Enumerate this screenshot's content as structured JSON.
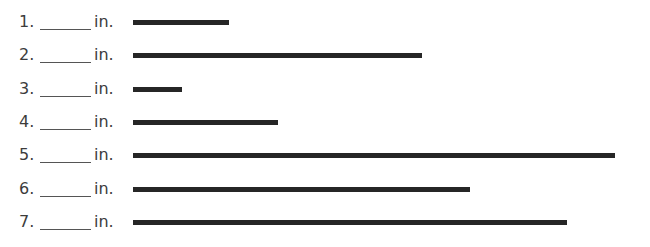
{
  "worksheet": {
    "unit_label": "in.",
    "bar_color": "#262626",
    "items": [
      {
        "number": "1.",
        "answer": "",
        "unit": "in.",
        "bar_length_px": 96
      },
      {
        "number": "2.",
        "answer": "",
        "unit": "in.",
        "bar_length_px": 289
      },
      {
        "number": "3.",
        "answer": "",
        "unit": "in.",
        "bar_length_px": 49
      },
      {
        "number": "4.",
        "answer": "",
        "unit": "in.",
        "bar_length_px": 145
      },
      {
        "number": "5.",
        "answer": "",
        "unit": "in.",
        "bar_length_px": 482
      },
      {
        "number": "6.",
        "answer": "",
        "unit": "in.",
        "bar_length_px": 337
      },
      {
        "number": "7.",
        "answer": "",
        "unit": "in.",
        "bar_length_px": 434
      }
    ]
  }
}
